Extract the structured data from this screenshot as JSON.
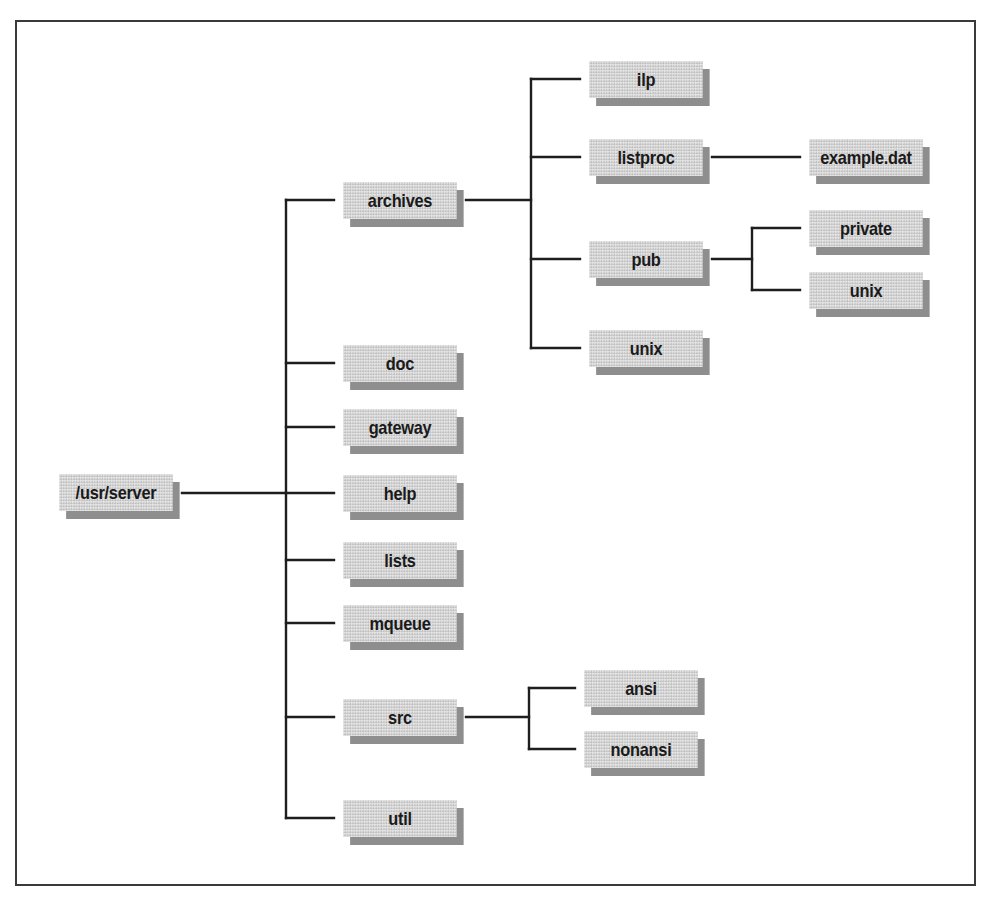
{
  "diagram": {
    "type": "directory-tree",
    "root": {
      "label": "/usr/server",
      "children": [
        {
          "label": "archives",
          "children": [
            {
              "label": "ilp"
            },
            {
              "label": "listproc",
              "children": [
                {
                  "label": "example.dat"
                }
              ]
            },
            {
              "label": "pub",
              "children": [
                {
                  "label": "private"
                },
                {
                  "label": "unix"
                }
              ]
            },
            {
              "label": "unix"
            }
          ]
        },
        {
          "label": "doc"
        },
        {
          "label": "gateway"
        },
        {
          "label": "help"
        },
        {
          "label": "lists"
        },
        {
          "label": "mqueue"
        },
        {
          "label": "src",
          "children": [
            {
              "label": "ansi"
            },
            {
              "label": "nonansi"
            }
          ]
        },
        {
          "label": "util"
        }
      ]
    }
  },
  "nodes": {
    "root": "/usr/server",
    "archives": "archives",
    "doc": "doc",
    "gateway": "gateway",
    "help": "help",
    "lists": "lists",
    "mqueue": "mqueue",
    "src": "src",
    "util": "util",
    "ilp": "ilp",
    "listproc": "listproc",
    "pub": "pub",
    "archives_unix": "unix",
    "example_dat": "example.dat",
    "private": "private",
    "pub_unix": "unix",
    "ansi": "ansi",
    "nonansi": "nonansi"
  },
  "colors": {
    "box_fill": "#d6d6d6",
    "box_shadow": "#8e8e8e",
    "line": "#1e1e1e",
    "frame": "#3a3a3a",
    "text": "#1a1a1a"
  }
}
